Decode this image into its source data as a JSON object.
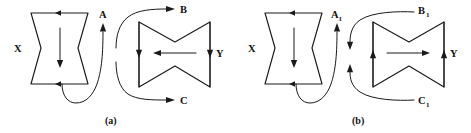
{
  "figure": {
    "background_color": "#ffffff",
    "ink_color": "#1a1a1a",
    "panels": [
      {
        "id": "a",
        "caption": "(a)",
        "source_label": "X",
        "target_label": "Y",
        "channel_labels": [
          "A",
          "B",
          "C"
        ],
        "channel_subscripts": [
          "",
          "",
          ""
        ],
        "source_shape": "vertical-bowtie",
        "target_shape": "horizontal-bowtie",
        "source_top_arrow_direction": "right",
        "source_bottom_arrow_direction": "right",
        "source_center_arrow_direction": "down",
        "target_left_arrow_direction": "down",
        "target_right_arrow_direction": "down",
        "target_center_arrow_direction": "left",
        "flow_direction": "outgoing",
        "connector_description": "Curve from X bottom loops up to A; S-curves leave toward B and C."
      },
      {
        "id": "b",
        "caption": "(b)",
        "source_label": "X",
        "target_label": "Y",
        "channel_labels": [
          "A",
          "B",
          "C"
        ],
        "channel_subscripts": [
          "1",
          "1",
          "1"
        ],
        "source_shape": "vertical-bowtie",
        "target_shape": "horizontal-bowtie",
        "source_top_arrow_direction": "right",
        "source_bottom_arrow_direction": "right",
        "source_center_arrow_direction": "down",
        "target_left_arrow_direction": "up",
        "target_right_arrow_direction": "up",
        "target_center_arrow_direction": "right",
        "flow_direction": "incoming",
        "connector_description": "Curve from X bottom loops up to A1; curves arrive from B1 and C1 into Y."
      }
    ]
  }
}
